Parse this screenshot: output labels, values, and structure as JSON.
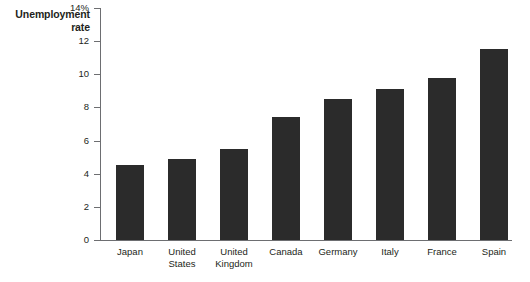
{
  "chart_data": {
    "type": "bar",
    "title": "",
    "xlabel": "",
    "ylabel": "Unemployment rate",
    "ylabel_lines": [
      "Unemployment",
      "rate"
    ],
    "categories": [
      "Japan",
      "United States",
      "United Kingdom",
      "Canada",
      "Germany",
      "Italy",
      "France",
      "Spain"
    ],
    "category_lines": [
      [
        "Japan"
      ],
      [
        "United",
        "States"
      ],
      [
        "United",
        "Kingdom"
      ],
      [
        "Canada"
      ],
      [
        "Germany"
      ],
      [
        "Italy"
      ],
      [
        "France"
      ],
      [
        "Spain"
      ]
    ],
    "values": [
      4.5,
      4.9,
      5.5,
      7.4,
      8.5,
      9.1,
      9.75,
      11.5
    ],
    "ylim": [
      0,
      14
    ],
    "ytick_values": [
      0,
      2,
      4,
      6,
      8,
      10,
      12,
      14
    ],
    "ytick_labels": [
      "0",
      "2",
      "4",
      "6",
      "8",
      "10",
      "12",
      "14%"
    ],
    "grid": false,
    "legend": false,
    "bar_color": "#2b2b2b",
    "axis_color": "#6d6e71",
    "background_color": "#ffffff"
  }
}
